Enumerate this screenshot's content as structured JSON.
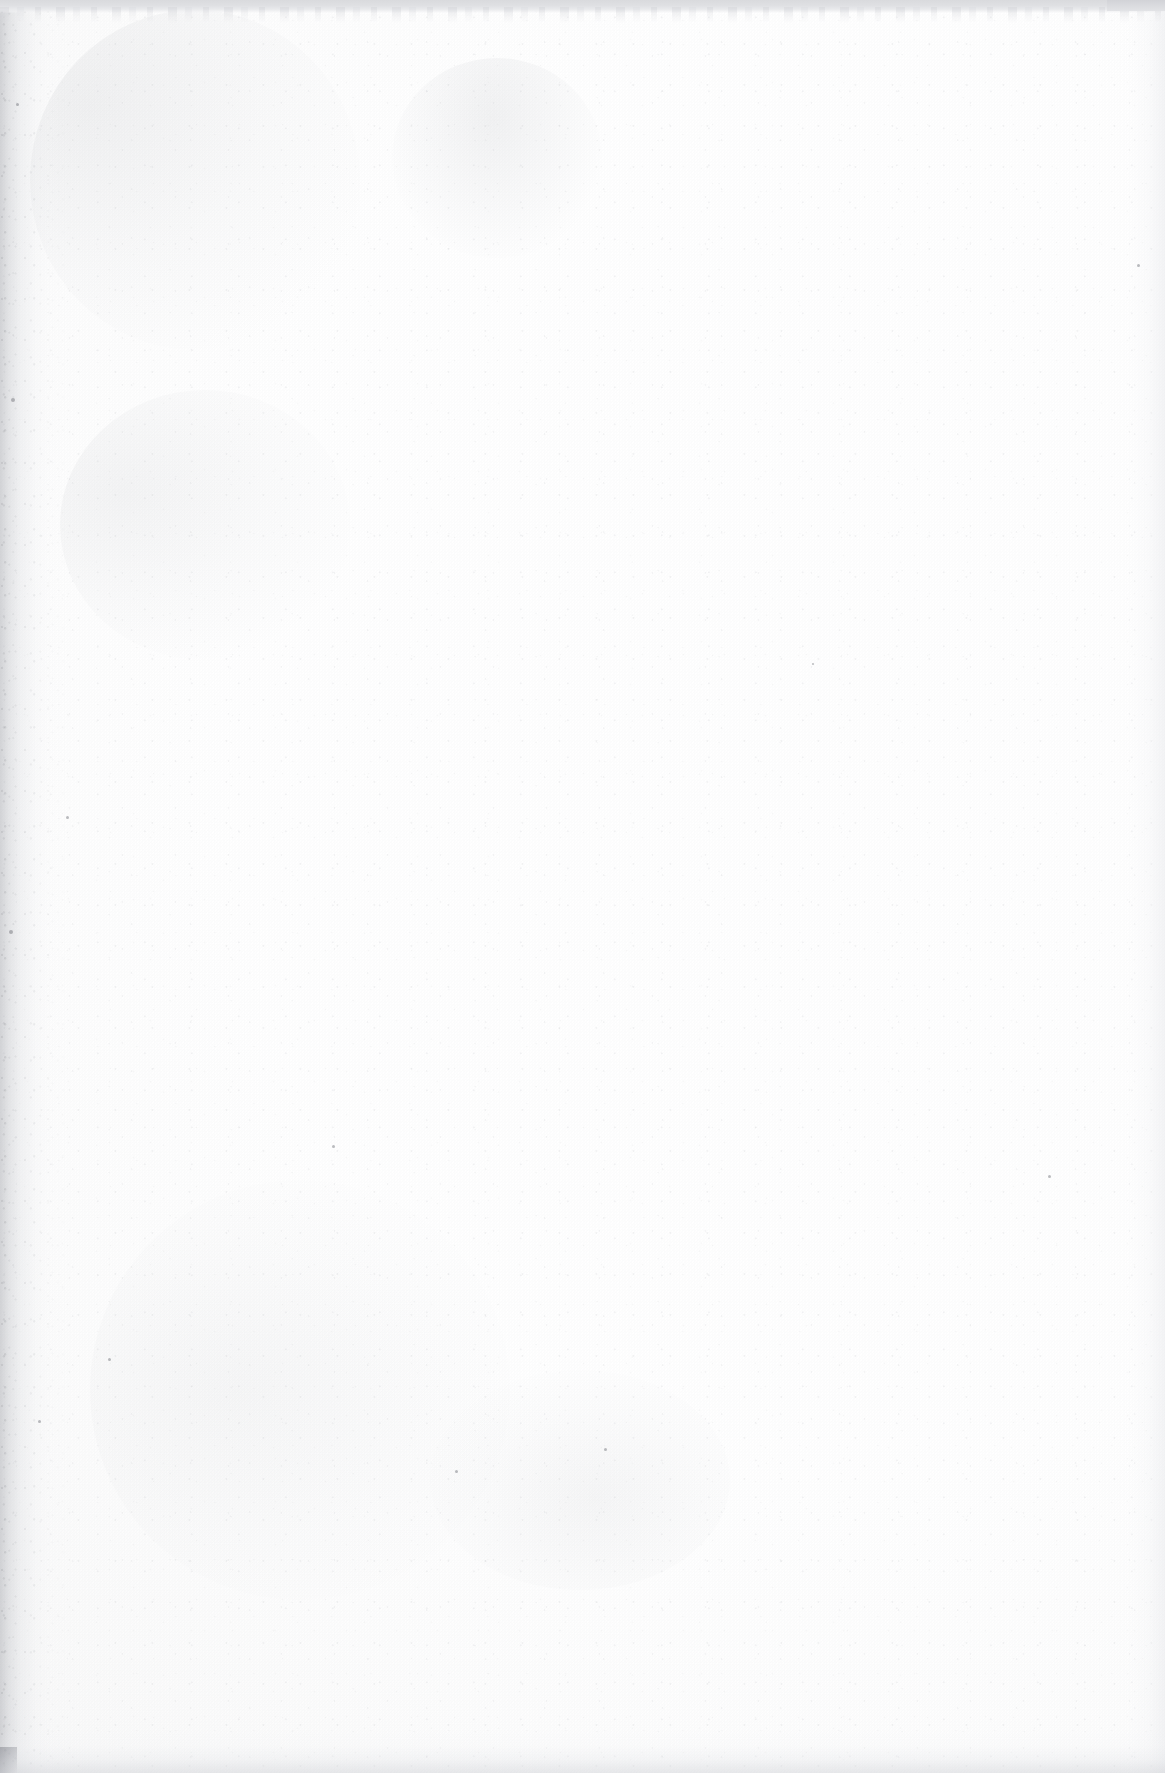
{
  "page": {
    "kind": "scanned-blank-page",
    "width_px": 1165,
    "height_px": 1773,
    "orientation": "portrait",
    "text_content": "",
    "visible_text_count": 0
  },
  "colors": {
    "paper_white": "#ffffff",
    "paper_offwhite": "#fdfdfd",
    "paper_shade": "#f6f6f7",
    "scan_band_gray": "#d9dadd",
    "scan_band_gray_light": "#e9eaec",
    "corner_patch_gray": "#d2d3d7",
    "gutter_shadow": "#a8aab0",
    "speck_gray": "#5c5f67"
  },
  "artifacts": {
    "top_band": {
      "name": "scan-border-band-top",
      "edge": "top",
      "thickness_px": 13,
      "color": "#d9dadd",
      "note": "Uniform gray scanner bed band spanning the full page width with an irregular, ragged lower boundary."
    },
    "top_right_patch": {
      "name": "scan-band-corner-patch",
      "position": "top-right",
      "width_px": 58,
      "height_px": 11,
      "color": "#d2d3d7",
      "note": "Slightly darker rectangular patch where the band meets the right margin."
    },
    "left_gutter": {
      "name": "gutter-shadow-left",
      "edge": "left",
      "width_px": 64,
      "color": "#a8aab0",
      "note": "Graduated gray shadow from the book gutter / page curl, fading to white near x=50."
    },
    "right_edge": {
      "name": "edge-fade-right",
      "edge": "right",
      "width_px": 46,
      "color": "#e2e3e7",
      "note": "Very subtle gradient fade along the right margin."
    },
    "bottom_edge": {
      "name": "edge-fade-bottom",
      "edge": "bottom",
      "height_px": 44,
      "color": "#cdcfd4",
      "note": "Soft gray gradient along the bottom margin, no hard band."
    },
    "bottom_left_block": {
      "name": "corner-block-bottom-left",
      "position": "bottom-left",
      "width_px": 17,
      "height_px": 26,
      "color": "#8a8c93",
      "note": "Small dark rectangular block at the extreme bottom-left corner."
    },
    "grain": {
      "name": "paper-grain-noise",
      "note": "Fine speckled paper tooth and scanner noise distributed across the entire sheet, densest within the left gutter band."
    },
    "smudges": [
      {
        "name": "smudge-upper-mid",
        "x": 392,
        "y": 58,
        "w": 210,
        "h": 200
      },
      {
        "name": "smudge-top-left",
        "x": 30,
        "y": 10,
        "w": 330,
        "h": 340
      },
      {
        "name": "smudge-mid-left",
        "x": 60,
        "y": 390,
        "w": 290,
        "h": 270
      },
      {
        "name": "smudge-lower-left",
        "x": 90,
        "y": 1180,
        "w": 420,
        "h": 420
      },
      {
        "name": "smudge-lower-mid",
        "x": 430,
        "y": 1370,
        "w": 300,
        "h": 220
      }
    ],
    "specks": [
      {
        "x": 1137,
        "y": 264,
        "d": 3
      },
      {
        "x": 16,
        "y": 103,
        "d": 3
      },
      {
        "x": 11,
        "y": 398,
        "d": 4
      },
      {
        "x": 9,
        "y": 930,
        "d": 4
      },
      {
        "x": 38,
        "y": 1420,
        "d": 3
      },
      {
        "x": 66,
        "y": 816,
        "d": 3
      },
      {
        "x": 332,
        "y": 1145,
        "d": 3
      },
      {
        "x": 1048,
        "y": 1175,
        "d": 3
      },
      {
        "x": 455,
        "y": 1470,
        "d": 3
      },
      {
        "x": 108,
        "y": 1358,
        "d": 3
      },
      {
        "x": 812,
        "y": 663,
        "d": 2
      },
      {
        "x": 604,
        "y": 1448,
        "d": 3
      }
    ]
  }
}
